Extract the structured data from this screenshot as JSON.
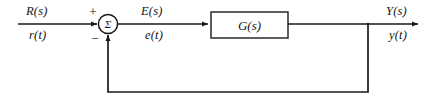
{
  "diagram": {
    "type": "control-system-block-diagram",
    "background_color": "#ffffff",
    "line_color": "#1a1a1a",
    "text_color": "#141414",
    "signals": {
      "input": {
        "laplace": "R(s)",
        "time": "r(t)"
      },
      "error": {
        "laplace": "E(s)",
        "time": "e(t)"
      },
      "output": {
        "laplace": "Y(s)",
        "time": "y(t)"
      }
    },
    "summing_junction": {
      "shape": "circle",
      "glyph": "Σ",
      "positive_sign": "+",
      "negative_sign": "−"
    },
    "blocks": [
      {
        "label": "G(s)",
        "shape": "rectangle"
      }
    ],
    "feedback": {
      "kind": "unity",
      "label": ""
    }
  }
}
